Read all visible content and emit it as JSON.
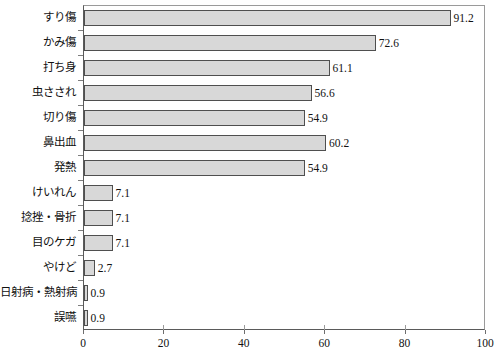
{
  "chart_data": {
    "type": "bar",
    "orientation": "horizontal",
    "title": "",
    "subtitle": "",
    "xlabel": "",
    "ylabel": "",
    "xlim": [
      0,
      100
    ],
    "xticks": [
      "0",
      "20",
      "40",
      "60",
      "80",
      "100"
    ],
    "xtick_values": [
      0,
      20,
      40,
      60,
      80,
      100
    ],
    "grid": false,
    "legend": null,
    "bar_fill_color": "#d8d8d8",
    "bar_edge_color": "#4f4f4f",
    "axis_color": "#5a5a5a",
    "categories": [
      "すり傷",
      "かみ傷",
      "打ち身",
      "虫さされ",
      "切り傷",
      "鼻出血",
      "発熱",
      "けいれん",
      "捻挫・骨折",
      "目のケガ",
      "やけど",
      "日射病・熱射病",
      "誤嚥"
    ],
    "values": [
      91.2,
      72.6,
      61.1,
      56.6,
      54.9,
      60.2,
      54.9,
      7.1,
      7.1,
      7.1,
      2.7,
      0.9,
      0.9
    ],
    "value_labels": [
      "91.2",
      "72.6",
      "61.1",
      "56.6",
      "54.9",
      "60.2",
      "54.9",
      "7.1",
      "7.1",
      "7.1",
      "2.7",
      "0.9",
      "0.9"
    ]
  }
}
